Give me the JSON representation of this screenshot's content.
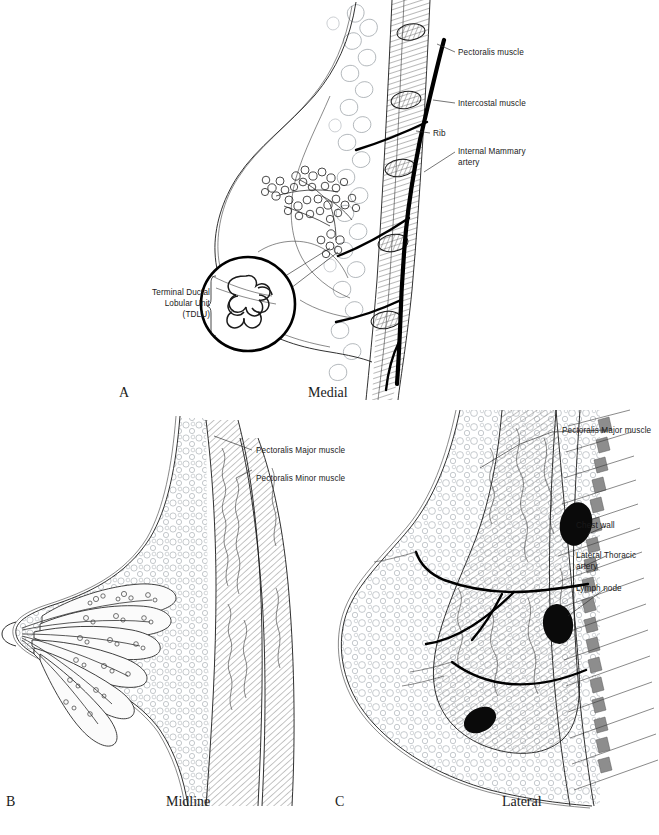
{
  "figure": {
    "colors": {
      "ink": "#1a1a1a",
      "fat_tissue": "#9aa0a6",
      "vessel": "#000000",
      "lymph_node": "#0a0a0a",
      "chest_wall": "#8d8d8d",
      "background": "#ffffff"
    }
  },
  "panels": [
    {
      "id": "A",
      "letter": "A",
      "caption": "Medial",
      "labels": [
        {
          "id": "pectoralis-muscle",
          "text": "Pectoralis muscle"
        },
        {
          "id": "intercostal-muscle",
          "text": "Intercostal muscle"
        },
        {
          "id": "rib",
          "text": "Rib"
        },
        {
          "id": "internal-mammary-artery",
          "line1": "Internal Mammary",
          "line2": "artery"
        },
        {
          "id": "tdlu",
          "line1": "Terminal Ductal",
          "line2": "Lobular Unit",
          "line3": "(TDLU)"
        }
      ]
    },
    {
      "id": "B",
      "letter": "B",
      "caption": "Midline",
      "labels": [
        {
          "id": "pectoralis-major-muscle",
          "text": "Pectoralis Major muscle"
        },
        {
          "id": "pectoralis-minor-muscle",
          "text": "Pectoralis Minor muscle"
        }
      ]
    },
    {
      "id": "C",
      "letter": "C",
      "caption": "Lateral",
      "labels": [
        {
          "id": "pectoralis-major-muscle",
          "text": "Pectoralis Major muscle"
        },
        {
          "id": "chest-wall",
          "text": "Chest wall"
        },
        {
          "id": "lateral-thoracic-artery",
          "line1": "Lateral Thoracic",
          "line2": "artery"
        },
        {
          "id": "lymph-node",
          "text": "Lymph node"
        }
      ]
    }
  ]
}
